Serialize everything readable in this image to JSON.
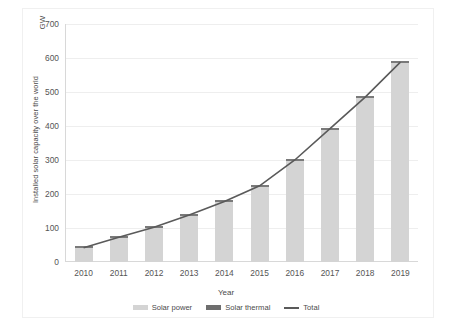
{
  "chart_data": {
    "type": "bar",
    "title": "",
    "xlabel": "Year",
    "ylabel": "Installed solar capacity over the world",
    "yunit": "GW",
    "categories": [
      "2010",
      "2011",
      "2012",
      "2013",
      "2014",
      "2015",
      "2016",
      "2017",
      "2018",
      "2019"
    ],
    "ylim": [
      0,
      700
    ],
    "yticks": [
      0,
      100,
      200,
      300,
      400,
      500,
      600,
      700
    ],
    "grid": true,
    "legend_position": "bottom",
    "series": [
      {
        "name": "Solar power",
        "type": "bar",
        "values": [
          40,
          71,
          100,
          136,
          176,
          222,
          297,
          389,
          482,
          585
        ]
      },
      {
        "name": "Solar thermal",
        "type": "bar",
        "values": [
          2,
          2,
          2,
          2,
          2,
          2,
          3,
          3,
          3,
          3
        ]
      },
      {
        "name": "Total",
        "type": "line",
        "values": [
          42,
          73,
          102,
          138,
          178,
          224,
          300,
          392,
          485,
          588
        ]
      }
    ]
  },
  "legend": {
    "items": [
      {
        "label": "Solar power",
        "swatch": "swatch-solar-power-icon"
      },
      {
        "label": "Solar thermal",
        "swatch": "swatch-solar-thermal-icon"
      },
      {
        "label": "Total",
        "swatch": "swatch-total-line-icon"
      }
    ]
  },
  "colors": {
    "bar_power": "#d4d4d4",
    "bar_thermal": "#7a7a7a",
    "total_line": "#5a5a5a",
    "gridline": "#eeeeee",
    "axis": "#d8d8d8",
    "text": "#555555"
  }
}
